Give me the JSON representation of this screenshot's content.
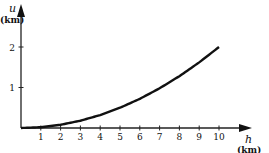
{
  "chart_data": {
    "type": "line",
    "title": "",
    "xlabel": "h",
    "xlabel_unit": "(km)",
    "ylabel": "u",
    "ylabel_unit": "(km)",
    "x_ticks": [
      "1",
      "2",
      "3",
      "4",
      "5",
      "6",
      "7",
      "8",
      "9",
      "10"
    ],
    "y_ticks": [
      "1",
      "2"
    ],
    "xlim": [
      0,
      10.5
    ],
    "ylim": [
      0,
      2.3
    ],
    "grid": false,
    "legend": null,
    "series": [
      {
        "name": "u(h)",
        "x": [
          0,
          1,
          2,
          3,
          4,
          5,
          6,
          7,
          8,
          9,
          10
        ],
        "values": [
          0,
          0.02,
          0.08,
          0.18,
          0.32,
          0.5,
          0.72,
          0.98,
          1.28,
          1.62,
          2.0
        ]
      }
    ]
  }
}
